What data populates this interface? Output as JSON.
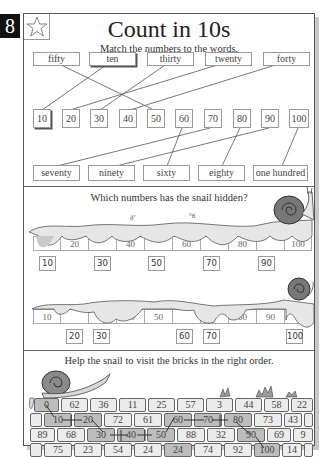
{
  "page": {
    "number": "8",
    "title": "Count in 10s",
    "star_icon": "star-outline-icon"
  },
  "section1": {
    "instruction": "Match the numbers to the words.",
    "top_words": [
      "fifty",
      "ten",
      "thirty",
      "twenty",
      "forty"
    ],
    "numbers": [
      "10",
      "20",
      "30",
      "40",
      "50",
      "60",
      "70",
      "80",
      "90",
      "100"
    ],
    "bottom_words": [
      "seventy",
      "ninety",
      "sixty",
      "eighty",
      "one hundred"
    ],
    "matches": [
      {
        "word": "fifty",
        "number": "50"
      },
      {
        "word": "ten",
        "number": "10"
      },
      {
        "word": "thirty",
        "number": "30"
      },
      {
        "word": "twenty",
        "number": "20"
      },
      {
        "word": "forty",
        "number": "40"
      },
      {
        "word": "seventy",
        "number": "70"
      },
      {
        "word": "ninety",
        "number": "90"
      },
      {
        "word": "sixty",
        "number": "60"
      },
      {
        "word": "eighty",
        "number": "80"
      },
      {
        "word": "one hundred",
        "number": "100"
      }
    ]
  },
  "section2": {
    "instruction": "Which numbers has the snail hidden?",
    "strip1": {
      "visible": [
        "",
        "20",
        "",
        "40",
        "",
        "60",
        "",
        "80",
        "",
        "100"
      ],
      "answers": [
        "10",
        "30",
        "50",
        "70",
        "90"
      ]
    },
    "strip2": {
      "visible": [
        "10",
        "",
        "",
        "40",
        "50",
        "",
        "",
        "80",
        "90",
        ""
      ],
      "answers": [
        "20",
        "30",
        "60",
        "70",
        "100"
      ]
    }
  },
  "section3": {
    "instruction": "Help the snail to visit the bricks in the right order.",
    "rows": [
      [
        "0",
        "62",
        "36",
        "11",
        "25",
        "57",
        "3",
        "44",
        "58",
        "22"
      ],
      [
        "",
        "10",
        "20",
        "72",
        "61",
        "60",
        "70",
        "80",
        "73",
        "43",
        ""
      ],
      [
        "89",
        "68",
        "30",
        "40",
        "50",
        "88",
        "32",
        "90",
        "69",
        "9"
      ],
      [
        "",
        "75",
        "23",
        "54",
        "24",
        "24",
        "74",
        "92",
        "100",
        "14",
        ""
      ]
    ],
    "path": [
      "0",
      "10",
      "20",
      "30",
      "40",
      "50",
      "60",
      "70",
      "80",
      "90",
      "100"
    ]
  }
}
